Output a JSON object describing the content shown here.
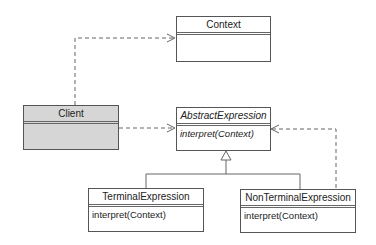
{
  "diagram": {
    "type": "uml-class",
    "classes": [
      {
        "id": "context",
        "name": "Context",
        "operations": [],
        "abstract": false
      },
      {
        "id": "client",
        "name": "Client",
        "operations": [],
        "abstract": false
      },
      {
        "id": "abstract_expression",
        "name": "AbstractExpression",
        "operations": [
          "interpret(Context)"
        ],
        "abstract": true
      },
      {
        "id": "terminal_expression",
        "name": "TerminalExpression",
        "operations": [
          "interpret(Context)"
        ],
        "abstract": false
      },
      {
        "id": "nonterminal_expression",
        "name": "NonTerminalExpression",
        "operations": [
          "interpret(Context)"
        ],
        "abstract": false
      }
    ],
    "relations": [
      {
        "from": "client",
        "to": "context",
        "kind": "dependency"
      },
      {
        "from": "client",
        "to": "abstract_expression",
        "kind": "dependency"
      },
      {
        "from": "nonterminal_expression",
        "to": "abstract_expression",
        "kind": "dependency"
      },
      {
        "from": "terminal_expression",
        "to": "abstract_expression",
        "kind": "generalization"
      },
      {
        "from": "nonterminal_expression",
        "to": "abstract_expression",
        "kind": "generalization"
      }
    ],
    "colors": {
      "client_fill": "#d6d6d6",
      "line": "#555555"
    }
  }
}
